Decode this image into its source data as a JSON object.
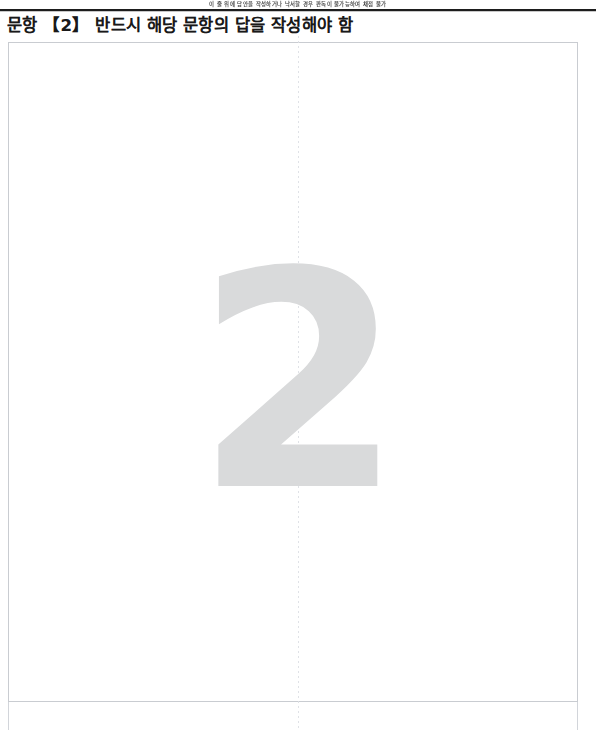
{
  "page": {
    "background_color": "#ffffff",
    "width": 596,
    "height": 730
  },
  "notice": {
    "text": "이 줄 위에 답안을 작성하거나 낙서할 경우 판독이 불가능하여 채점 불가"
  },
  "header": {
    "title": "문항 【2】 반드시 해당 문항의 답을 작성해야 함",
    "question_number": "2",
    "rule_color": "#1d1d1d"
  },
  "answer_area": {
    "content": "",
    "border_color": "#c9ccd1",
    "fold_line_color": "#dcdfe4"
  },
  "watermark": {
    "text": "2",
    "color": "#d9dadb"
  }
}
